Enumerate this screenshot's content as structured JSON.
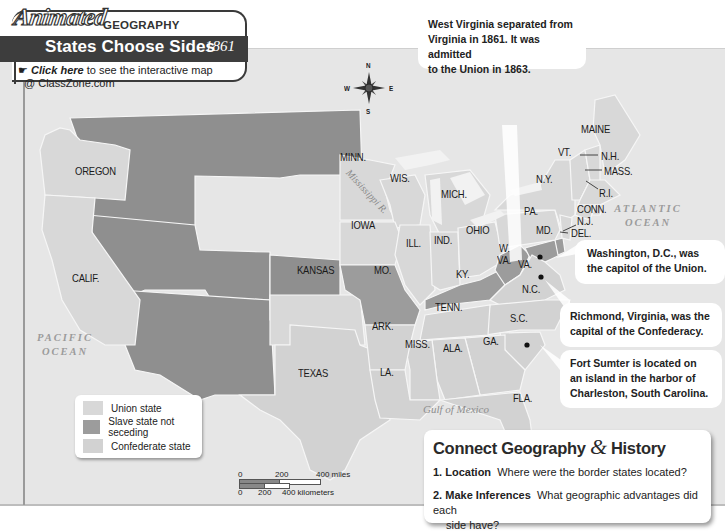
{
  "header": {
    "badge": "Animated",
    "category": "GEOGRAPHY",
    "title": "States Choose Sides",
    "year": "1861",
    "link_label": "Click here",
    "link_text": " to see the interactive map",
    "link_site": "@ ClassZone.com"
  },
  "compass": {
    "n": "N",
    "s": "S",
    "e": "E",
    "w": "W"
  },
  "states": {
    "oregon": "OREGON",
    "calif": "CALIF.",
    "kansas": "KANSAS",
    "texas": "TEXAS",
    "minn": "MINN.",
    "wis": "WIS.",
    "mich": "MICH.",
    "iowa": "IOWA",
    "ill": "ILL.",
    "ind": "IND.",
    "ohio": "OHIO",
    "mo": "MO.",
    "ky": "KY.",
    "wva1": "W.",
    "wva2": "VA.",
    "va": "VA.",
    "pa": "PA.",
    "ny": "N.Y.",
    "md": "MD.",
    "del": "DEL.",
    "nj": "N.J.",
    "conn": "CONN.",
    "ri": "R.I.",
    "mass": "MASS.",
    "nh": "N.H.",
    "vt": "VT.",
    "maine": "MAINE",
    "nc": "N.C.",
    "tenn": "TENN.",
    "sc": "S.C.",
    "ark": "ARK.",
    "miss": "MISS.",
    "ala": "ALA.",
    "ga": "GA.",
    "la": "LA.",
    "fla": "FLA."
  },
  "water": {
    "atlantic1": "ATLANTIC",
    "atlantic2": "OCEAN",
    "pacific1": "PACIFIC",
    "pacific2": "OCEAN",
    "gulf": "Gulf of Mexico",
    "river": "Mississippi R."
  },
  "callouts": {
    "wva": [
      "West Virginia separated from",
      "Virginia in 1861. It was admitted",
      "to the Union in 1863."
    ],
    "dc": [
      "Washington, D.C., was",
      "the capitol of the Union."
    ],
    "richmond": [
      "Richmond, Virginia, was the",
      "capital of the Confederacy."
    ],
    "sumter": [
      "Fort Sumter is located on",
      "an island in the harbor of",
      "Charleston, South Carolina."
    ]
  },
  "legend": {
    "items": [
      {
        "label": "Union state",
        "color": "#d8d8d8"
      },
      {
        "label": "Slave state not seceding",
        "color": "#9c9c9c"
      },
      {
        "label": "Confederate state",
        "color": "#d2d2d2"
      }
    ]
  },
  "scale": {
    "miles": [
      "0",
      "200",
      "400 miles"
    ],
    "km": [
      "0",
      "200",
      "400 kilometers"
    ]
  },
  "connect": {
    "title_a": "Connect Geography ",
    "amp": "&",
    "title_b": " History",
    "q1_num": "1.",
    "q1_label": "Location",
    "q1_text": "Where were the border states located?",
    "q2_num": "2.",
    "q2_label": "Make Inferences",
    "q2_text": "What geographic advantages did each",
    "q2_text2": "side have?"
  }
}
